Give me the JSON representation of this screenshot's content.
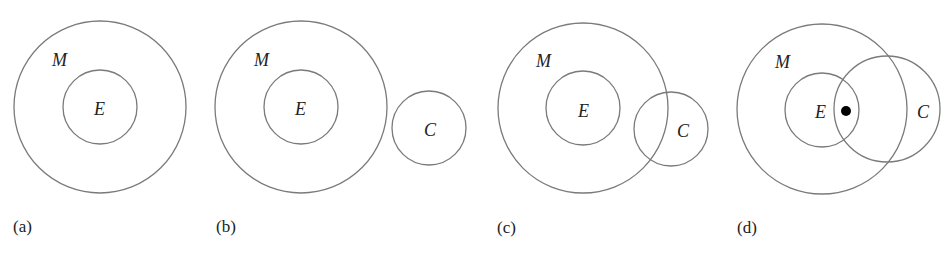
{
  "figure": {
    "stroke_color": "#7a7a7a",
    "panels": [
      {
        "id": "a",
        "caption": "(a)",
        "caption_pos": [
          13,
          232
        ],
        "circles": [
          {
            "set": "M",
            "cx": 100,
            "cy": 107,
            "r": 86,
            "label": "M",
            "label_pos": [
              52,
              66
            ]
          },
          {
            "set": "E",
            "cx": 100,
            "cy": 107,
            "r": 37,
            "label": "E",
            "label_pos": [
              94,
              115
            ]
          }
        ],
        "points": []
      },
      {
        "id": "b",
        "caption": "(b)",
        "caption_pos": [
          216,
          232
        ],
        "circles": [
          {
            "set": "M",
            "cx": 301,
            "cy": 107,
            "r": 86,
            "label": "M",
            "label_pos": [
              254,
              66
            ]
          },
          {
            "set": "E",
            "cx": 301,
            "cy": 107,
            "r": 37,
            "label": "E",
            "label_pos": [
              295,
              115
            ]
          },
          {
            "set": "C",
            "cx": 429,
            "cy": 128,
            "r": 37,
            "label": "C",
            "label_pos": [
              424,
              136
            ]
          }
        ],
        "points": []
      },
      {
        "id": "c",
        "caption": "(c)",
        "caption_pos": [
          497,
          233
        ],
        "circles": [
          {
            "set": "M",
            "cx": 583,
            "cy": 108,
            "r": 85,
            "label": "M",
            "label_pos": [
              536,
              67
            ]
          },
          {
            "set": "E",
            "cx": 583,
            "cy": 108,
            "r": 37,
            "label": "E",
            "label_pos": [
              578,
              117
            ]
          },
          {
            "set": "C",
            "cx": 671,
            "cy": 129,
            "r": 37,
            "label": "C",
            "label_pos": [
              677,
              137
            ]
          }
        ],
        "points": []
      },
      {
        "id": "d",
        "caption": "(d)",
        "caption_pos": [
          737,
          233
        ],
        "circles": [
          {
            "set": "M",
            "cx": 822,
            "cy": 109,
            "r": 85,
            "label": "M",
            "label_pos": [
              775,
              68
            ]
          },
          {
            "set": "E",
            "cx": 822,
            "cy": 110,
            "r": 37,
            "label": "E",
            "label_pos": [
              815,
              118
            ]
          },
          {
            "set": "C",
            "cx": 887,
            "cy": 109,
            "r": 53,
            "label": "C",
            "label_pos": [
              917,
              118
            ]
          }
        ],
        "points": [
          {
            "cx": 846,
            "cy": 111,
            "r": 5
          }
        ]
      }
    ]
  }
}
